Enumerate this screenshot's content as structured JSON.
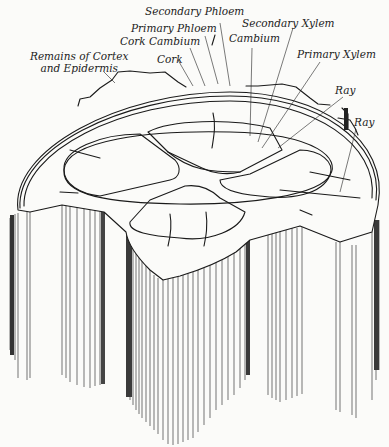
{
  "figure": {
    "labels": {
      "secondary_phloem": "Secondary Phloem",
      "primary_phloem": "Primary Phloem",
      "cork_cambium": "Cork Cambium",
      "cork": "Cork",
      "remains_line1": "Remains of Cortex",
      "remains_line2": "and Epidermis",
      "secondary_xylem": "Secondary Xylem",
      "cambium": "Cambium",
      "primary_xylem": "Primary Xylem",
      "ray_1": "Ray",
      "ray_2": "Ray"
    }
  }
}
